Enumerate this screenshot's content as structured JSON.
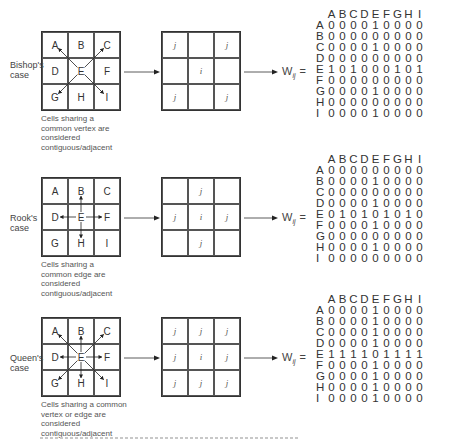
{
  "cases": [
    {
      "id": "bishop",
      "label": "Bishop's case",
      "grid_letters": [
        "A",
        "B",
        "C",
        "D",
        "E",
        "F",
        "G",
        "H",
        "I"
      ],
      "arrows_from_E_to": [
        "A",
        "C",
        "G",
        "I"
      ],
      "caption": "Cells sharing a common vertex are considered contiguous/adjacent",
      "pattern": [
        "j",
        "",
        "j",
        "",
        "i",
        "",
        "j",
        "",
        "j"
      ],
      "weight_label": "W",
      "weight_sub": "ij",
      "equals": "=",
      "matrix": {
        "columns": [
          "A",
          "B",
          "C",
          "D",
          "E",
          "F",
          "G",
          "H",
          "I"
        ],
        "rows": [
          {
            "label": "A",
            "values": [
              0,
              0,
              0,
              0,
              1,
              0,
              0,
              0,
              0
            ]
          },
          {
            "label": "B",
            "values": [
              0,
              0,
              0,
              0,
              0,
              0,
              0,
              0,
              0
            ]
          },
          {
            "label": "C",
            "values": [
              0,
              0,
              0,
              0,
              1,
              0,
              0,
              0,
              0
            ]
          },
          {
            "label": "D",
            "values": [
              0,
              0,
              0,
              0,
              0,
              0,
              0,
              0,
              0
            ]
          },
          {
            "label": "E",
            "values": [
              1,
              0,
              1,
              0,
              0,
              0,
              1,
              0,
              1
            ]
          },
          {
            "label": "F",
            "values": [
              0,
              0,
              0,
              0,
              0,
              0,
              0,
              0,
              0
            ]
          },
          {
            "label": "G",
            "values": [
              0,
              0,
              0,
              0,
              1,
              0,
              0,
              0,
              0
            ]
          },
          {
            "label": "H",
            "values": [
              0,
              0,
              0,
              0,
              0,
              0,
              0,
              0,
              0
            ]
          },
          {
            "label": "I",
            "values": [
              0,
              0,
              0,
              0,
              1,
              0,
              0,
              0,
              0
            ]
          }
        ]
      }
    },
    {
      "id": "rook",
      "label": "Rook's case",
      "grid_letters": [
        "A",
        "B",
        "C",
        "D",
        "E",
        "F",
        "G",
        "H",
        "I"
      ],
      "arrows_from_E_to": [
        "B",
        "D",
        "F",
        "H"
      ],
      "caption": "Cells sharing a common edge are considered contiguous/adjacent",
      "pattern": [
        "",
        "j",
        "",
        "j",
        "i",
        "j",
        "",
        "j",
        ""
      ],
      "weight_label": "W",
      "weight_sub": "ij",
      "equals": "=",
      "matrix": {
        "columns": [
          "A",
          "B",
          "C",
          "D",
          "E",
          "F",
          "G",
          "H",
          "I"
        ],
        "rows": [
          {
            "label": "A",
            "values": [
              0,
              0,
              0,
              0,
              0,
              0,
              0,
              0,
              0
            ]
          },
          {
            "label": "B",
            "values": [
              0,
              0,
              0,
              0,
              1,
              0,
              0,
              0,
              0
            ]
          },
          {
            "label": "C",
            "values": [
              0,
              0,
              0,
              0,
              0,
              0,
              0,
              0,
              0
            ]
          },
          {
            "label": "D",
            "values": [
              0,
              0,
              0,
              0,
              1,
              0,
              0,
              0,
              0
            ]
          },
          {
            "label": "E",
            "values": [
              0,
              1,
              0,
              1,
              0,
              1,
              0,
              1,
              0
            ]
          },
          {
            "label": "F",
            "values": [
              0,
              0,
              0,
              0,
              1,
              0,
              0,
              0,
              0
            ]
          },
          {
            "label": "G",
            "values": [
              0,
              0,
              0,
              0,
              0,
              0,
              0,
              0,
              0
            ]
          },
          {
            "label": "H",
            "values": [
              0,
              0,
              0,
              0,
              1,
              0,
              0,
              0,
              0
            ]
          },
          {
            "label": "I",
            "values": [
              0,
              0,
              0,
              0,
              0,
              0,
              0,
              0,
              0
            ]
          }
        ]
      }
    },
    {
      "id": "queen",
      "label": "Queen's case",
      "grid_letters": [
        "A",
        "B",
        "C",
        "D",
        "E",
        "F",
        "G",
        "H",
        "I"
      ],
      "arrows_from_E_to": [
        "A",
        "B",
        "C",
        "D",
        "F",
        "G",
        "H",
        "I"
      ],
      "caption": "Cells sharing a common vertex or edge are considered contiguous/adjacent",
      "pattern": [
        "j",
        "j",
        "j",
        "j",
        "i",
        "j",
        "j",
        "j",
        "j"
      ],
      "weight_label": "W",
      "weight_sub": "ij",
      "equals": "=",
      "matrix": {
        "columns": [
          "A",
          "B",
          "C",
          "D",
          "E",
          "F",
          "G",
          "H",
          "I"
        ],
        "rows": [
          {
            "label": "A",
            "values": [
              0,
              0,
              0,
              0,
              1,
              0,
              0,
              0,
              0
            ]
          },
          {
            "label": "B",
            "values": [
              0,
              0,
              0,
              0,
              1,
              0,
              0,
              0,
              0
            ]
          },
          {
            "label": "C",
            "values": [
              0,
              0,
              0,
              0,
              1,
              0,
              0,
              0,
              0
            ]
          },
          {
            "label": "D",
            "values": [
              0,
              0,
              0,
              0,
              1,
              0,
              0,
              0,
              0
            ]
          },
          {
            "label": "E",
            "values": [
              1,
              1,
              1,
              1,
              0,
              1,
              1,
              1,
              1
            ]
          },
          {
            "label": "F",
            "values": [
              0,
              0,
              0,
              0,
              1,
              0,
              0,
              0,
              0
            ]
          },
          {
            "label": "G",
            "values": [
              0,
              0,
              0,
              0,
              1,
              0,
              0,
              0,
              0
            ]
          },
          {
            "label": "H",
            "values": [
              0,
              0,
              0,
              0,
              1,
              0,
              0,
              0,
              0
            ]
          },
          {
            "label": "I",
            "values": [
              0,
              0,
              0,
              0,
              1,
              0,
              0,
              0,
              0
            ]
          }
        ]
      }
    }
  ],
  "layout": {
    "section_tops": [
      0,
      146,
      286
    ]
  },
  "bottom_caption_truncated": true
}
